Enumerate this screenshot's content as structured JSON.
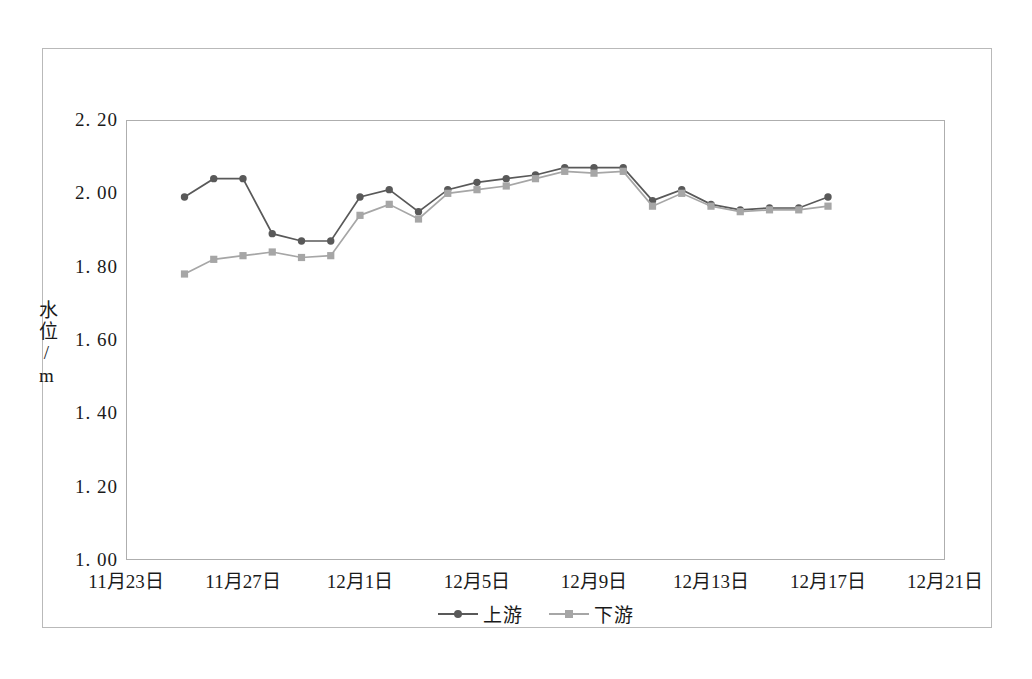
{
  "chart_data": {
    "type": "line",
    "title": "",
    "xlabel": "",
    "ylabel": "水位/m",
    "ylim": [
      1.0,
      2.2
    ],
    "ytick_step": 0.2,
    "ytick_labels": [
      "2. 20",
      "2. 00",
      "1. 80",
      "1. 60",
      "1. 40",
      "1. 20",
      "1. 00"
    ],
    "ytick_values": [
      2.2,
      2.0,
      1.8,
      1.6,
      1.4,
      1.2,
      1.0
    ],
    "xtick_labels": [
      "11月23日",
      "11月27日",
      "12月1日",
      "12月5日",
      "12月9日",
      "12月13日",
      "12月17日",
      "12月21日"
    ],
    "xtick_day_index": [
      0,
      4,
      8,
      12,
      16,
      20,
      24,
      28
    ],
    "xlim_day_index": [
      0,
      28
    ],
    "grid": true,
    "legend_position": "bottom-center",
    "x": [
      2,
      3,
      4,
      5,
      6,
      7,
      8,
      9,
      10,
      11,
      12,
      13,
      14,
      15,
      16,
      17,
      18,
      19,
      20,
      21,
      22,
      23,
      24
    ],
    "series": [
      {
        "name": "上游",
        "color": "#595959",
        "marker": "circle",
        "values": [
          1.99,
          2.04,
          2.04,
          1.89,
          1.87,
          1.87,
          1.99,
          2.01,
          1.95,
          2.01,
          2.03,
          2.04,
          2.05,
          2.07,
          2.07,
          2.07,
          1.98,
          2.01,
          1.97,
          1.955,
          1.96,
          1.96,
          1.99
        ]
      },
      {
        "name": "下游",
        "color": "#a6a6a6",
        "marker": "square",
        "values": [
          1.78,
          1.82,
          1.83,
          1.84,
          1.825,
          1.83,
          1.94,
          1.97,
          1.93,
          2.0,
          2.01,
          2.02,
          2.04,
          2.06,
          2.055,
          2.06,
          1.965,
          2.0,
          1.965,
          1.95,
          1.955,
          1.955,
          1.965
        ]
      }
    ],
    "legend": [
      {
        "label": "上游",
        "color": "#595959",
        "marker": "circle"
      },
      {
        "label": "下游",
        "color": "#a6a6a6",
        "marker": "square"
      }
    ]
  }
}
